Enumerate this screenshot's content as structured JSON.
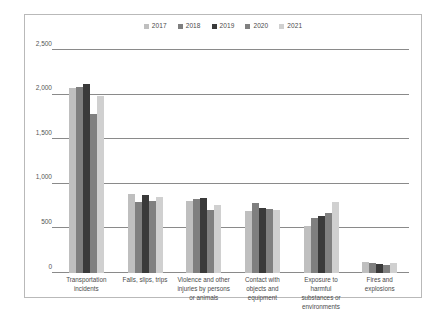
{
  "chart_data": {
    "type": "bar",
    "title": "",
    "xlabel": "",
    "ylabel": "",
    "ylim": [
      0,
      2500
    ],
    "ytick_labels": [
      "0",
      "500",
      "1,000",
      "1,500",
      "2,000",
      "2,500"
    ],
    "ytick_values": [
      0,
      500,
      1000,
      1500,
      2000,
      2500
    ],
    "grid": true,
    "legend_position": "top-center",
    "categories": [
      "Transportation incidents",
      "Falls, slips, trips",
      "Violence and other injuries by persons or animals",
      "Contact with objects and equipment",
      "Exposure to harmful substances or environments",
      "Fires and explosions"
    ],
    "series": [
      {
        "name": "2017",
        "color": "#bfbfbf",
        "values": [
          2077,
          887,
          807,
          695,
          531,
          123
        ]
      },
      {
        "name": "2018",
        "color": "#7f7f7f",
        "values": [
          2080,
          791,
          828,
          786,
          621,
          115
        ]
      },
      {
        "name": "2019",
        "color": "#3a3a3a",
        "values": [
          2122,
          880,
          841,
          732,
          642,
          99
        ]
      },
      {
        "name": "2020",
        "color": "#808080",
        "values": [
          1778,
          805,
          705,
          716,
          672,
          90
        ]
      },
      {
        "name": "2021",
        "color": "#d0d0d0",
        "values": [
          1982,
          850,
          761,
          705,
          798,
          107
        ]
      }
    ]
  },
  "legend": {
    "items": [
      {
        "label": "2017",
        "color": "#bfbfbf"
      },
      {
        "label": "2018",
        "color": "#7f7f7f"
      },
      {
        "label": "2019",
        "color": "#3a3a3a"
      },
      {
        "label": "2020",
        "color": "#808080"
      },
      {
        "label": "2021",
        "color": "#d0d0d0"
      }
    ]
  },
  "xaxis": {
    "labels": [
      [
        "Transportation",
        "incidents"
      ],
      [
        "Falls, slips, trips"
      ],
      [
        "Violence and other",
        "injuries by persons",
        "or animals"
      ],
      [
        "Contact with",
        "objects and",
        "equipment"
      ],
      [
        "Exposure to",
        "harmful",
        "substances or",
        "environments"
      ],
      [
        "Fires and",
        "explosions"
      ]
    ]
  }
}
